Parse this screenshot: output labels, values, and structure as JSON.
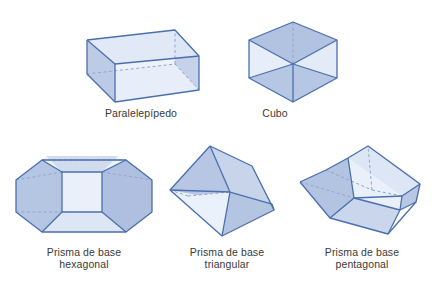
{
  "page": {
    "background_color": "#ffffff",
    "title_language": "es",
    "figure_count": 5
  },
  "palette": {
    "stroke": "#4a6fae",
    "stroke_dashed": "#8aa3ce",
    "face_dark": "#b2c3e2",
    "face_mid": "#c6d3ea",
    "face_light": "#e3ebf7",
    "face_pale": "#eff4fb",
    "label_color": "#3a3a38"
  },
  "figures": [
    {
      "id": "parallelepiped",
      "name": "paralelepipedo",
      "caption": "Paralelepípedo",
      "faces": 6,
      "base_shape": "rectangle"
    },
    {
      "id": "cube",
      "name": "cubo",
      "caption": "Cubo",
      "faces": 6,
      "base_shape": "square"
    },
    {
      "id": "hexagonal-prism",
      "name": "prisma-hexagonal",
      "caption": "Prisma de base\nhexagonal",
      "faces": 8,
      "base_shape": "hexagon"
    },
    {
      "id": "triangular-prism",
      "name": "prisma-triangular",
      "caption": "Prisma de base\ntriangular",
      "faces": 5,
      "base_shape": "triangle"
    },
    {
      "id": "pentagonal-prism",
      "name": "prisma-pentagonal",
      "caption": "Prisma de base\npentagonal",
      "faces": 7,
      "base_shape": "pentagon"
    }
  ]
}
